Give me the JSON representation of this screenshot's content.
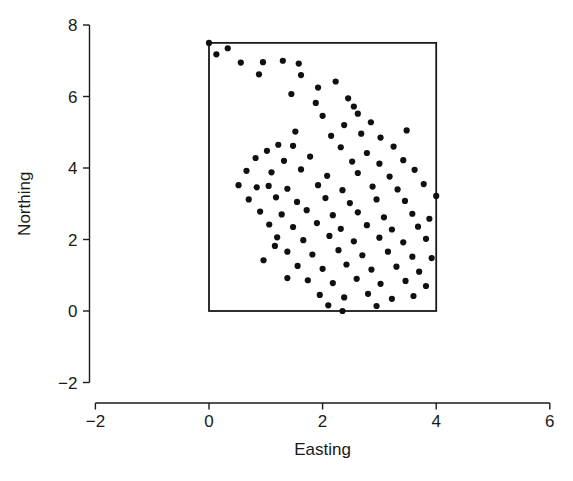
{
  "chart_data": {
    "type": "scatter",
    "title": "",
    "xlabel": "Easting",
    "ylabel": "Northing",
    "xlim": [
      -3.0,
      6.6
    ],
    "ylim": [
      -2.9,
      8.45
    ],
    "xticks": [
      -2,
      0,
      2,
      4,
      6
    ],
    "xtick_labels": [
      "−2",
      "0",
      "2",
      "4",
      "6"
    ],
    "yticks": [
      -2,
      0,
      2,
      4,
      6,
      8
    ],
    "ytick_labels": [
      "−2",
      "0",
      "2",
      "4",
      "6",
      "8"
    ],
    "grid": false,
    "legend": null,
    "point_marker": "filled-circle",
    "point_color": "#101010",
    "point_size_px": 4.0,
    "boundary_box": {
      "x0": 0.0,
      "y0": 0.0,
      "x1": 4.0,
      "y1": 7.5,
      "stroke": "#1a1a1a"
    },
    "points": [
      [
        0.0,
        7.5
      ],
      [
        0.33,
        7.35
      ],
      [
        0.13,
        7.18
      ],
      [
        0.56,
        6.95
      ],
      [
        0.95,
        6.96
      ],
      [
        0.88,
        6.62
      ],
      [
        1.3,
        7.0
      ],
      [
        1.58,
        6.92
      ],
      [
        1.62,
        6.6
      ],
      [
        1.92,
        6.25
      ],
      [
        1.45,
        6.07
      ],
      [
        2.23,
        6.42
      ],
      [
        1.88,
        5.82
      ],
      [
        2.45,
        5.95
      ],
      [
        2.0,
        5.46
      ],
      [
        2.38,
        5.2
      ],
      [
        2.62,
        5.52
      ],
      [
        2.85,
        5.28
      ],
      [
        1.52,
        5.02
      ],
      [
        2.15,
        4.9
      ],
      [
        2.68,
        4.96
      ],
      [
        3.02,
        4.85
      ],
      [
        1.22,
        4.65
      ],
      [
        1.48,
        4.62
      ],
      [
        1.02,
        4.48
      ],
      [
        2.32,
        4.58
      ],
      [
        2.78,
        4.42
      ],
      [
        3.25,
        4.6
      ],
      [
        0.82,
        4.28
      ],
      [
        1.32,
        4.2
      ],
      [
        1.78,
        4.32
      ],
      [
        2.52,
        4.18
      ],
      [
        3.0,
        4.12
      ],
      [
        3.42,
        4.22
      ],
      [
        0.66,
        3.92
      ],
      [
        1.1,
        3.88
      ],
      [
        1.62,
        3.96
      ],
      [
        2.08,
        3.78
      ],
      [
        2.62,
        3.86
      ],
      [
        3.18,
        3.76
      ],
      [
        3.62,
        3.95
      ],
      [
        0.52,
        3.52
      ],
      [
        0.84,
        3.46
      ],
      [
        1.05,
        3.5
      ],
      [
        1.38,
        3.42
      ],
      [
        1.92,
        3.52
      ],
      [
        2.35,
        3.38
      ],
      [
        2.88,
        3.48
      ],
      [
        3.32,
        3.4
      ],
      [
        3.78,
        3.55
      ],
      [
        0.7,
        3.12
      ],
      [
        1.18,
        3.18
      ],
      [
        1.55,
        3.05
      ],
      [
        2.05,
        3.16
      ],
      [
        2.48,
        3.02
      ],
      [
        2.95,
        3.12
      ],
      [
        3.45,
        3.08
      ],
      [
        4.0,
        3.22
      ],
      [
        0.9,
        2.78
      ],
      [
        1.28,
        2.7
      ],
      [
        1.72,
        2.82
      ],
      [
        2.18,
        2.68
      ],
      [
        2.62,
        2.76
      ],
      [
        3.08,
        2.62
      ],
      [
        3.58,
        2.72
      ],
      [
        3.88,
        2.58
      ],
      [
        1.06,
        2.42
      ],
      [
        1.48,
        2.35
      ],
      [
        1.9,
        2.46
      ],
      [
        2.32,
        2.3
      ],
      [
        2.78,
        2.4
      ],
      [
        3.22,
        2.28
      ],
      [
        3.68,
        2.36
      ],
      [
        1.2,
        2.06
      ],
      [
        1.66,
        1.98
      ],
      [
        2.12,
        2.1
      ],
      [
        2.55,
        1.95
      ],
      [
        3.0,
        2.05
      ],
      [
        3.42,
        1.92
      ],
      [
        3.82,
        2.02
      ],
      [
        1.38,
        1.66
      ],
      [
        1.82,
        1.58
      ],
      [
        2.28,
        1.7
      ],
      [
        2.7,
        1.56
      ],
      [
        3.15,
        1.66
      ],
      [
        3.58,
        1.52
      ],
      [
        3.92,
        1.48
      ],
      [
        1.56,
        1.26
      ],
      [
        2.0,
        1.18
      ],
      [
        2.42,
        1.3
      ],
      [
        2.86,
        1.16
      ],
      [
        3.3,
        1.24
      ],
      [
        3.7,
        1.1
      ],
      [
        1.74,
        0.86
      ],
      [
        2.18,
        0.78
      ],
      [
        2.6,
        0.9
      ],
      [
        3.02,
        0.76
      ],
      [
        3.46,
        0.84
      ],
      [
        3.82,
        0.7
      ],
      [
        1.95,
        0.45
      ],
      [
        2.38,
        0.38
      ],
      [
        2.8,
        0.48
      ],
      [
        3.22,
        0.34
      ],
      [
        3.6,
        0.42
      ],
      [
        2.35,
        0.0
      ],
      [
        2.1,
        0.16
      ],
      [
        2.95,
        0.14
      ],
      [
        1.38,
        0.92
      ],
      [
        0.96,
        1.42
      ],
      [
        1.16,
        1.82
      ],
      [
        2.55,
        5.72
      ],
      [
        3.48,
        5.05
      ]
    ]
  },
  "axes": {
    "x_axis_name": "easting-axis",
    "y_axis_name": "northing-axis"
  }
}
